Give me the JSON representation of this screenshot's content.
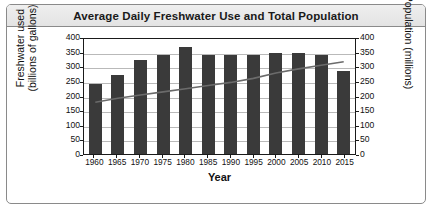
{
  "chart_data": {
    "type": "bar",
    "title": "Average Daily Freshwater Use and Total Population",
    "xlabel": "Year",
    "ylabel": "Freshwater used (billions of gallons)",
    "ylabel_right": "Population (millions)",
    "categories": [
      "1960",
      "1965",
      "1970",
      "1975",
      "1980",
      "1985",
      "1990",
      "1995",
      "2000",
      "2005",
      "2010",
      "2015"
    ],
    "ylim": [
      0,
      400
    ],
    "yticks": [
      0,
      50,
      100,
      150,
      200,
      250,
      300,
      350,
      400
    ],
    "ylim_right": [
      0,
      400
    ],
    "yticks_right": [
      0,
      50,
      100,
      150,
      200,
      250,
      300,
      350,
      400
    ],
    "grid": true,
    "legend": "none",
    "series": [
      {
        "name": "Freshwater used (billions of gallons)",
        "type": "bar",
        "axis": "left",
        "color": "#3a3a3a",
        "values": [
          240,
          270,
          320,
          340,
          365,
          338,
          340,
          340,
          345,
          345,
          340,
          285
        ]
      },
      {
        "name": "Population (millions)",
        "type": "line",
        "axis": "right",
        "color": "#6b6b6b",
        "values": [
          180,
          194,
          205,
          216,
          227,
          238,
          249,
          263,
          282,
          296,
          309,
          321
        ]
      }
    ]
  },
  "axis_titles": {
    "left_line1": "Freshwater used",
    "left_line2": "(billions of gallons)",
    "right": "Population (millions)"
  }
}
